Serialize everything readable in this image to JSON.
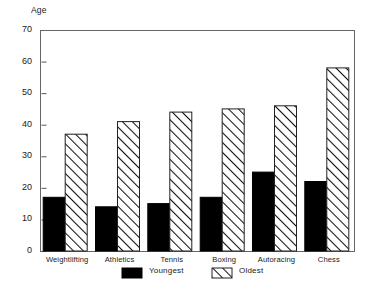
{
  "chart_data": {
    "type": "bar",
    "title": "",
    "subtitle": "",
    "xlabel": "",
    "ylabel": "Age",
    "ylim": [
      0,
      70
    ],
    "ytick_step": 10,
    "yticks": [
      0,
      10,
      20,
      30,
      40,
      50,
      60,
      70
    ],
    "ytick_labels": [
      "0",
      "10",
      "20",
      "30",
      "40",
      "50",
      "60",
      "70"
    ],
    "grid": false,
    "legend_position": "bottom",
    "categories": [
      "Weightlifting",
      "Athletics",
      "Tennis",
      "Boxing",
      "Autoracing",
      "Chess"
    ],
    "series": [
      {
        "name": "Youngest",
        "style": "solid-black",
        "color": "#000000",
        "values": [
          17,
          14,
          15,
          17,
          25,
          22
        ]
      },
      {
        "name": "Oldest",
        "style": "diagonal-hatch",
        "color": "#ffffff",
        "values": [
          37,
          41,
          44,
          45,
          46,
          58
        ]
      }
    ],
    "annotations": []
  },
  "legend": {
    "items": [
      {
        "label": "Youngest",
        "swatch": "solid-black"
      },
      {
        "label": "Oldest",
        "swatch": "diagonal-hatch"
      }
    ]
  },
  "colors": {
    "axis": "#555555",
    "frame": "#666666",
    "bar_solid": "#000000",
    "bar_hatch_line": "#111111",
    "bar_hatch_fill": "#ffffff",
    "background": "#ffffff",
    "text": "#1a1a1a"
  }
}
